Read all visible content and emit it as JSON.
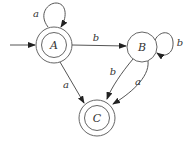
{
  "diagram": {
    "type": "finite-automaton",
    "states": [
      {
        "id": "A",
        "label": "A",
        "start": true,
        "accepting": true
      },
      {
        "id": "B",
        "label": "B",
        "start": false,
        "accepting": false
      },
      {
        "id": "C",
        "label": "C",
        "start": false,
        "accepting": true
      }
    ],
    "transitions": [
      {
        "from": "A",
        "to": "A",
        "label": "a"
      },
      {
        "from": "A",
        "to": "B",
        "label": "b"
      },
      {
        "from": "B",
        "to": "B",
        "label": "b"
      },
      {
        "from": "A",
        "to": "C",
        "label": "a"
      },
      {
        "from": "B",
        "to": "C",
        "label": "b"
      },
      {
        "from": "B",
        "to": "C",
        "label": "a"
      }
    ]
  },
  "labels": {
    "state_a": "A",
    "state_b": "B",
    "state_c": "C",
    "loop_a": "a",
    "edge_ab": "b",
    "loop_b": "b",
    "edge_ac": "a",
    "edge_bc_1": "b",
    "edge_bc_2": "a"
  },
  "colors": {
    "stroke": "#555555",
    "text": "#333333",
    "background": "#ffffff"
  }
}
